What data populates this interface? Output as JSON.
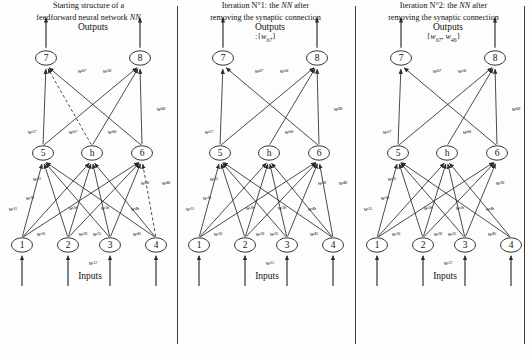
{
  "figure": {
    "layout": "three-panel-neural-network-pruning-sequence",
    "panel_count": 3
  },
  "labels": {
    "outputs": "Outputs",
    "inputs": "Inputs"
  },
  "nodes": {
    "input": [
      "1",
      "2",
      "3",
      "4"
    ],
    "hidden": [
      "5",
      "h",
      "6"
    ],
    "output": [
      "7",
      "8"
    ]
  },
  "weights": {
    "w15": {
      "base": "w",
      "sub": "15"
    },
    "w1h": {
      "base": "w",
      "sub": "1h"
    },
    "w16": {
      "base": "w",
      "sub": "16"
    },
    "w25": {
      "base": "w",
      "sub": "25"
    },
    "w2h": {
      "base": "w",
      "sub": "2h"
    },
    "w26": {
      "base": "w",
      "sub": "26"
    },
    "w35": {
      "base": "w",
      "sub": "35"
    },
    "w3h": {
      "base": "w",
      "sub": "3h"
    },
    "w36": {
      "base": "w",
      "sub": "36"
    },
    "w45": {
      "base": "w",
      "sub": "45"
    },
    "w4h": {
      "base": "w",
      "sub": "4h"
    },
    "w46": {
      "base": "w",
      "sub": "46"
    },
    "w57": {
      "base": "w",
      "sub": "57"
    },
    "w58": {
      "base": "w",
      "sub": "58"
    },
    "wh7": {
      "base": "w",
      "sub": "h7"
    },
    "wh8": {
      "base": "w",
      "sub": "h8"
    },
    "w67": {
      "base": "w",
      "sub": "67"
    },
    "w68": {
      "base": "w",
      "sub": "68"
    },
    "w12": {
      "base": "w",
      "sub": "12"
    }
  },
  "panels": [
    {
      "id": "panel-0",
      "caption_line1": "Starting structure of a",
      "caption_line2_pre": "feedforward neural network ",
      "caption_line2_em": "NN",
      "set_prefix": "",
      "set_text": "",
      "dashed_edges": [
        "h-7",
        "4-6"
      ],
      "removed_edges": []
    },
    {
      "id": "panel-1",
      "caption_line1_pre": "Iteration N°1: the ",
      "caption_line1_em": "NN",
      "caption_line1_post": " after",
      "caption_line2": "removing the synaptic connection",
      "set_prefix": ":{",
      "set_items": [
        {
          "base": "w",
          "sub": "h7"
        }
      ],
      "set_suffix": "}",
      "dashed_edges": [],
      "removed_edges": [
        "h-7"
      ]
    },
    {
      "id": "panel-2",
      "caption_line1_pre": "Iteration N°2: the ",
      "caption_line1_em": "NN",
      "caption_line1_post": " after",
      "caption_line2": "removing the synaptic connection",
      "set_prefix": "{",
      "set_items": [
        {
          "base": "w",
          "sub": "h7"
        },
        {
          "base": "w",
          "sub": "46"
        }
      ],
      "set_suffix": "}",
      "dashed_edges": [],
      "removed_edges": [
        "h-7",
        "4-6"
      ]
    }
  ],
  "colors": {
    "stroke": "#2b2b2b",
    "node_fill": "#ffffff",
    "text": "#111111",
    "divider": "#3a3a3a",
    "background": "#fdfdfd"
  }
}
